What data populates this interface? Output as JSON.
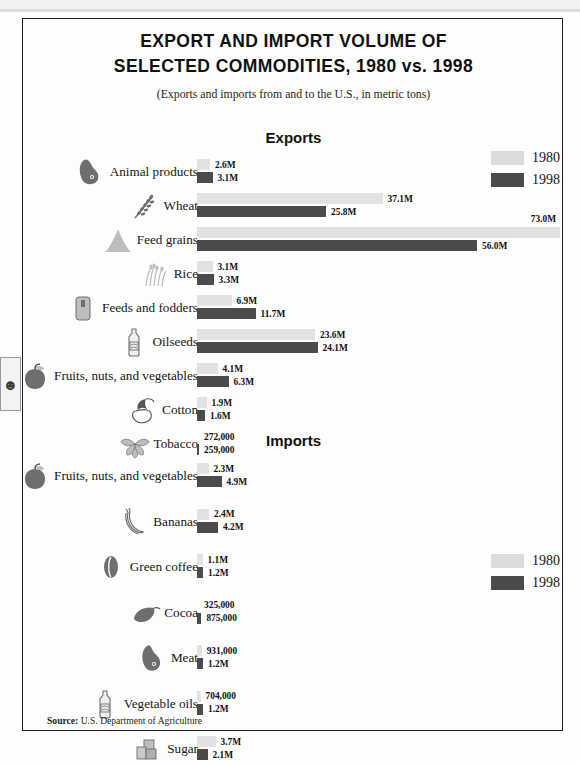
{
  "title_line1": "EXPORT AND IMPORT VOLUME OF",
  "title_line2": "SELECTED COMMODITIES, 1980 vs. 1998",
  "subtitle": "(Exports and imports from and to the U.S., in metric tons)",
  "source_label": "Source:",
  "source_text": "U.S. Department of Agriculture",
  "legend": {
    "series1": "1980",
    "series2": "1998"
  },
  "colors": {
    "bar_1980": "#e2e2e2",
    "bar_1998": "#4b4b4b",
    "frame": "#1d1d1d",
    "text": "#161616"
  },
  "chart_data": {
    "type": "bar",
    "title": "EXPORT AND IMPORT VOLUME OF SELECTED COMMODITIES, 1980 vs. 1998",
    "subtitle": "(Exports and imports from and to the U.S., in metric tons)",
    "xlabel": "",
    "ylabel": "",
    "unit": "metric tons",
    "orientation": "horizontal",
    "grid": false,
    "legend_position": "right",
    "legend_entries": [
      "1980",
      "1998"
    ],
    "axis_max_value": 73.0,
    "panels": [
      {
        "name": "Exports",
        "heading": "Exports",
        "categories": [
          "Animal products",
          "Wheat",
          "Feed grains",
          "Rice",
          "Feeds and fodders",
          "Oilseeds",
          "Fruits, nuts, and vegetables",
          "Cotton",
          "Tobacco"
        ],
        "icons": [
          "animal-products-icon",
          "wheat-icon",
          "feed-grains-icon",
          "rice-icon",
          "feeds-and-fodders-icon",
          "oilseeds-icon",
          "fruits-nuts-vegetables-icon",
          "cotton-icon",
          "tobacco-icon"
        ],
        "series": [
          {
            "name": "1980",
            "values": [
              2.6,
              37.1,
              73.0,
              3.1,
              6.9,
              23.6,
              4.1,
              1.9,
              0.272
            ],
            "labels": [
              "2.6M",
              "37.1M",
              "73.0M",
              "3.1M",
              "6.9M",
              "23.6M",
              "4.1M",
              "1.9M",
              "272,000"
            ]
          },
          {
            "name": "1998",
            "values": [
              3.1,
              25.8,
              56.0,
              3.3,
              11.7,
              24.1,
              6.3,
              1.6,
              0.259
            ],
            "labels": [
              "3.1M",
              "25.8M",
              "56.0M",
              "3.3M",
              "11.7M",
              "24.1M",
              "6.3M",
              "1.6M",
              "259,000"
            ]
          }
        ]
      },
      {
        "name": "Imports",
        "heading": "Imports",
        "categories": [
          "Fruits, nuts, and vegetables",
          "Bananas",
          "Green coffee",
          "Cocoa",
          "Meat",
          "Vegetable oils",
          "Sugar"
        ],
        "icons": [
          "fruits-nuts-vegetables-icon",
          "bananas-icon",
          "green-coffee-icon",
          "cocoa-icon",
          "meat-icon",
          "vegetable-oils-icon",
          "sugar-icon"
        ],
        "series": [
          {
            "name": "1980",
            "values": [
              2.3,
              2.4,
              1.1,
              0.325,
              0.931,
              0.704,
              3.7
            ],
            "labels": [
              "2.3M",
              "2.4M",
              "1.1M",
              "325,000",
              "931,000",
              "704,000",
              "3.7M"
            ]
          },
          {
            "name": "1998",
            "values": [
              4.9,
              4.2,
              1.2,
              0.875,
              1.2,
              1.2,
              2.1
            ],
            "labels": [
              "4.9M",
              "4.2M",
              "1.2M",
              "875,000",
              "1.2M",
              "1.2M",
              "2.1M"
            ]
          }
        ]
      }
    ]
  }
}
